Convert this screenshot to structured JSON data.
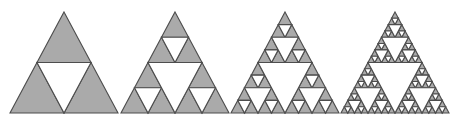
{
  "figure": {
    "background_color": "#ffffff",
    "fill_color": "#aaaaaa",
    "stroke_color": "#4d4d4d",
    "hole_color": "#ffffff",
    "stroke_width": 1.1,
    "canvas": {
      "width": 450,
      "height": 126
    },
    "geometry": {
      "baseline_y": 113,
      "apex_y": 12,
      "half_width": 54,
      "apex_x_positions": [
        64,
        175,
        285,
        395
      ]
    },
    "panels": [
      {
        "name": "stage-1",
        "label": "Stage 1",
        "depth": 1,
        "apex_x": 64,
        "filled_triangles": 3,
        "hole_triangles": 1
      },
      {
        "name": "stage-2",
        "label": "Stage 2",
        "depth": 2,
        "apex_x": 175,
        "filled_triangles": 9,
        "hole_triangles": 4
      },
      {
        "name": "stage-3",
        "label": "Stage 3",
        "depth": 3,
        "apex_x": 285,
        "filled_triangles": 27,
        "hole_triangles": 13
      },
      {
        "name": "stage-4",
        "label": "Stage 4",
        "depth": 4,
        "apex_x": 395,
        "filled_triangles": 81,
        "hole_triangles": 40
      }
    ]
  },
  "chart_data": {
    "type": "diagram",
    "subtitle": "",
    "xlabel": "",
    "ylabel": "",
    "categories": [
      "Stage 1",
      "Stage 2",
      "Stage 3",
      "Stage 4"
    ],
    "series": [
      {
        "name": "Iteration depth",
        "values": [
          1,
          2,
          3,
          4
        ]
      },
      {
        "name": "Filled sub-triangles",
        "values": [
          3,
          9,
          27,
          81
        ]
      },
      {
        "name": "Removed (white) sub-triangles",
        "values": [
          1,
          4,
          13,
          40
        ]
      }
    ],
    "annotations": [],
    "legend_position": "none",
    "grid": false
  }
}
